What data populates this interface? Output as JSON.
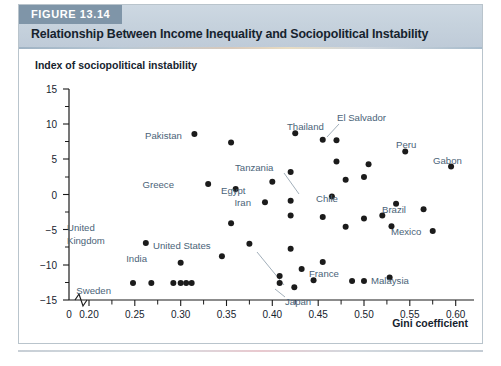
{
  "figure": {
    "tag": "FIGURE 13.14",
    "title": "Relationship Between Income Inequality and Sociopolitical Instability"
  },
  "chart_data": {
    "type": "scatter",
    "title": "Relationship Between Income Inequality and Sociopolitical Instability",
    "xlabel": "Gini coefficient",
    "ylabel": "Index of sociopolitical instability",
    "xlim": [
      0.18,
      0.67
    ],
    "ylim": [
      -15,
      15
    ],
    "axis_break_at_x": 0.185,
    "grid": false,
    "legend": null,
    "xticks": [
      "0",
      "0.20",
      "0.25",
      "0.30",
      "0.35",
      "0.40",
      "0.45",
      "0.50",
      "0.55",
      "0.60",
      "0.65"
    ],
    "xtick_values": [
      0.185,
      0.2,
      0.25,
      0.3,
      0.35,
      0.4,
      0.45,
      0.5,
      0.55,
      0.6,
      0.65
    ],
    "yticks": [
      "15",
      "10",
      "5",
      "0",
      "-5",
      "-10",
      "-15"
    ],
    "ytick_values": [
      15,
      10,
      5,
      0,
      -5,
      -10,
      -15
    ],
    "ytick_minor": [
      12.5,
      7.5,
      2.5,
      -2.5,
      -7.5,
      -12.5
    ],
    "points": [
      {
        "label": "Pakistan",
        "x": 0.315,
        "y": 8.6,
        "label_pos": "left"
      },
      {
        "label": "",
        "x": 0.355,
        "y": 7.4
      },
      {
        "label": "Thailand",
        "x": 0.425,
        "y": 8.7,
        "label_pos": "right-up"
      },
      {
        "label": "",
        "x": 0.455,
        "y": 7.8
      },
      {
        "label": "El Salvador",
        "x": 0.47,
        "y": 7.7,
        "label_pos": "leader-up"
      },
      {
        "label": "Peru",
        "x": 0.545,
        "y": 6.1,
        "label_pos": "right"
      },
      {
        "label": "",
        "x": 0.47,
        "y": 4.7
      },
      {
        "label": "",
        "x": 0.505,
        "y": 4.3
      },
      {
        "label": "Gabon",
        "x": 0.595,
        "y": 4.0,
        "label_pos": "right"
      },
      {
        "label": "Tanzania",
        "x": 0.42,
        "y": 3.2,
        "label_pos": "leader-left"
      },
      {
        "label": "",
        "x": 0.4,
        "y": 1.8
      },
      {
        "label": "",
        "x": 0.48,
        "y": 2.1
      },
      {
        "label": "Greece",
        "x": 0.33,
        "y": 1.5,
        "label_pos": "left"
      },
      {
        "label": "Egypt",
        "x": 0.36,
        "y": 0.8,
        "label_pos": "right"
      },
      {
        "label": "",
        "x": 0.5,
        "y": 2.5
      },
      {
        "label": "Chile",
        "x": 0.465,
        "y": -0.3,
        "label_pos": "right"
      },
      {
        "label": "Iran",
        "x": 0.392,
        "y": -1.1,
        "label_pos": "left"
      },
      {
        "label": "",
        "x": 0.42,
        "y": -0.9
      },
      {
        "label": "",
        "x": 0.535,
        "y": -1.3
      },
      {
        "label": "Brazil",
        "x": 0.565,
        "y": -2.1,
        "label_pos": "right"
      },
      {
        "label": "",
        "x": 0.42,
        "y": -3.0
      },
      {
        "label": "",
        "x": 0.455,
        "y": -3.2
      },
      {
        "label": "",
        "x": 0.5,
        "y": -3.4
      },
      {
        "label": "",
        "x": 0.52,
        "y": -3.0
      },
      {
        "label": "",
        "x": 0.355,
        "y": -4.1
      },
      {
        "label": "",
        "x": 0.48,
        "y": -4.6
      },
      {
        "label": "",
        "x": 0.53,
        "y": -4.5
      },
      {
        "label": "Mexico",
        "x": 0.575,
        "y": -5.2,
        "label_pos": "right"
      },
      {
        "label": "United Kingdom",
        "x": 0.262,
        "y": -6.9,
        "label_pos": "above"
      },
      {
        "label": "",
        "x": 0.375,
        "y": -7.0
      },
      {
        "label": "",
        "x": 0.42,
        "y": -7.7
      },
      {
        "label": "",
        "x": 0.345,
        "y": -8.8
      },
      {
        "label": "India",
        "x": 0.3,
        "y": -9.7,
        "label_pos": "left"
      },
      {
        "label": "",
        "x": 0.455,
        "y": -9.6
      },
      {
        "label": "France",
        "x": 0.432,
        "y": -10.6,
        "label_pos": "right"
      },
      {
        "label": "United States",
        "x": 0.408,
        "y": -11.6,
        "label_pos": "leader-up"
      },
      {
        "label": "",
        "x": 0.408,
        "y": -12.6
      },
      {
        "label": "Malaysia",
        "x": 0.528,
        "y": -11.8,
        "label_pos": "right"
      },
      {
        "label": "",
        "x": 0.445,
        "y": -12.2
      },
      {
        "label": "",
        "x": 0.487,
        "y": -12.3
      },
      {
        "label": "",
        "x": 0.5,
        "y": -12.3
      },
      {
        "label": "Sweden",
        "x": 0.248,
        "y": -12.6,
        "label_pos": "left"
      },
      {
        "label": "",
        "x": 0.268,
        "y": -12.6
      },
      {
        "label": "",
        "x": 0.292,
        "y": -12.6
      },
      {
        "label": "",
        "x": 0.3,
        "y": -12.6
      },
      {
        "label": "",
        "x": 0.306,
        "y": -12.6
      },
      {
        "label": "",
        "x": 0.312,
        "y": -12.6
      },
      {
        "label": "Japan",
        "x": 0.424,
        "y": -13.2,
        "label_pos": "leader-down"
      }
    ],
    "annotations": [
      {
        "text": "Pakistan"
      },
      {
        "text": "Thailand"
      },
      {
        "text": "El Salvador"
      },
      {
        "text": "Peru"
      },
      {
        "text": "Gabon"
      },
      {
        "text": "Tanzania"
      },
      {
        "text": "Greece"
      },
      {
        "text": "Egypt"
      },
      {
        "text": "Chile"
      },
      {
        "text": "Iran"
      },
      {
        "text": "Brazil"
      },
      {
        "text": "Mexico"
      },
      {
        "text": "United Kingdom"
      },
      {
        "text": "India"
      },
      {
        "text": "France"
      },
      {
        "text": "United States"
      },
      {
        "text": "Malaysia"
      },
      {
        "text": "Sweden"
      },
      {
        "text": "Japan"
      }
    ]
  },
  "labels": {
    "y_axis_title": "Index of sociopolitical instability",
    "x_axis_title": "Gini coefficient",
    "y_15": "15",
    "y_10": "10",
    "y_5": "5",
    "y_0": "0",
    "y_m5": "−5",
    "y_m10": "−10",
    "y_m15": "−15",
    "x_0": "0",
    "x_020": "0.20",
    "x_025": "0.25",
    "x_030": "0.30",
    "x_035": "0.35",
    "x_040": "0.40",
    "x_045": "0.45",
    "x_050": "0.50",
    "x_055": "0.55",
    "x_060": "0.60",
    "x_065": "0.65",
    "c_pakistan": "Pakistan",
    "c_thailand": "Thailand",
    "c_elsalvador": "El Salvador",
    "c_peru": "Peru",
    "c_gabon": "Gabon",
    "c_tanzania": "Tanzania",
    "c_greece": "Greece",
    "c_egypt": "Egypt",
    "c_chile": "Chile",
    "c_iran": "Iran",
    "c_brazil": "Brazil",
    "c_mexico": "Mexico",
    "c_uk1": "United",
    "c_uk2": "Kingdom",
    "c_india": "India",
    "c_france": "France",
    "c_us": "United States",
    "c_malaysia": "Malaysia",
    "c_sweden": "Sweden",
    "c_japan": "Japan"
  },
  "colors": {
    "header_band": "#c6d2dd",
    "tag_bg": "#7f95a8",
    "point": "#1b1b1b",
    "country_label": "#4a6378",
    "axis": "#1b1b1b",
    "card_border": "#b9c4cc"
  }
}
